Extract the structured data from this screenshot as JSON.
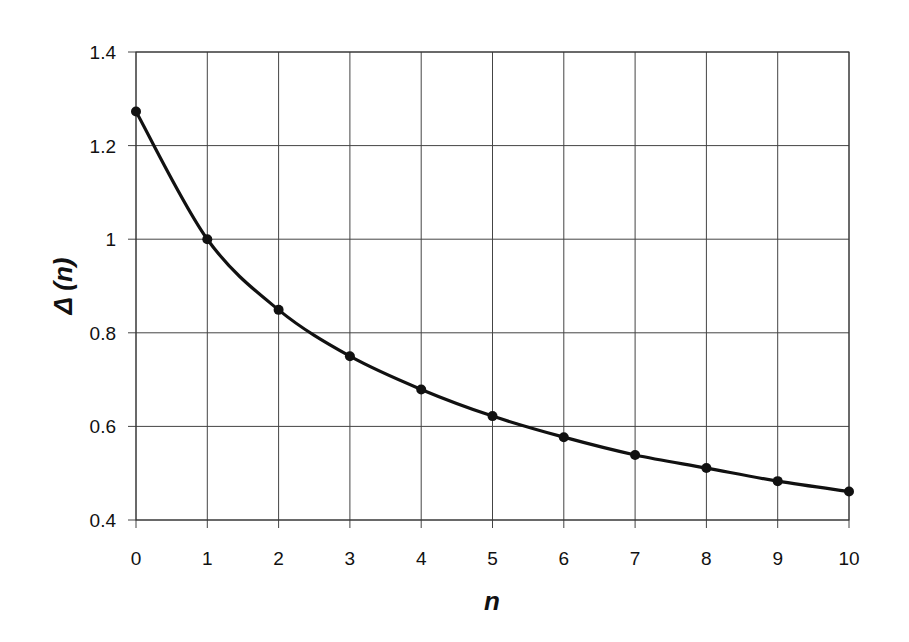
{
  "chart_data": {
    "type": "line",
    "title": "",
    "xlabel": "n",
    "ylabel": "Δ (n)",
    "x": [
      0,
      1,
      2,
      3,
      4,
      5,
      6,
      7,
      8,
      9,
      10
    ],
    "series": [
      {
        "name": "Δ(n)",
        "values": [
          1.273,
          1.0,
          0.849,
          0.75,
          0.679,
          0.622,
          0.577,
          0.539,
          0.511,
          0.483,
          0.461
        ],
        "color": "#111111",
        "marker": "circle",
        "smooth": true
      }
    ],
    "xlim": [
      0,
      10
    ],
    "ylim": [
      0.4,
      1.4
    ],
    "x_ticks": [
      "0",
      "1",
      "2",
      "3",
      "4",
      "5",
      "6",
      "7",
      "8",
      "9",
      "10"
    ],
    "y_ticks": [
      "0.4",
      "0.6",
      "0.8",
      "1",
      "1.2",
      "1.4"
    ],
    "grid": true,
    "legend": "none"
  }
}
